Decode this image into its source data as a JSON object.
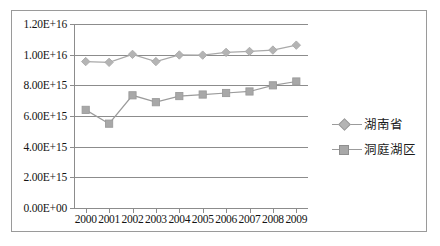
{
  "chart_data": {
    "type": "line",
    "title": "",
    "xlabel": "",
    "ylabel": "",
    "grid": true,
    "legend_position": "right",
    "categories": [
      "2000",
      "2001",
      "2002",
      "2003",
      "2004",
      "2005",
      "2006",
      "2007",
      "2008",
      "2009"
    ],
    "ylim": [
      0,
      1.2e+16
    ],
    "ytick_labels": [
      "0.00E+00",
      "2.00E+15",
      "4.00E+15",
      "6.00E+15",
      "8.00E+15",
      "1.00E+16",
      "1.20E+16"
    ],
    "ytick_values": [
      0,
      2000000000000000.0,
      4000000000000000.0,
      6000000000000000.0,
      8000000000000000.0,
      1e+16,
      1.2e+16
    ],
    "series": [
      {
        "name": "湖南省",
        "marker": "diamond",
        "color": "#b4b4b4",
        "line_color": "#a9a9a9",
        "values": [
          9550000000000000.0,
          9500000000000000.0,
          1.002e+16,
          9550000000000000.0,
          9980000000000000.0,
          9970000000000000.0,
          1.015e+16,
          1.021e+16,
          1.03e+16,
          1.062e+16
        ]
      },
      {
        "name": "洞庭湖区",
        "marker": "square",
        "color": "#a8a8a8",
        "line_color": "#9b9b9b",
        "values": [
          6400000000000000.0,
          5500000000000000.0,
          7350000000000000.0,
          6900000000000000.0,
          7300000000000000.0,
          7400000000000000.0,
          7500000000000000.0,
          7600000000000000.0,
          8000000000000000.0,
          8250000000000000.0
        ]
      }
    ]
  },
  "legend": {
    "entries": [
      {
        "label": "湖南省",
        "marker": "diamond-marker-icon"
      },
      {
        "label": "洞庭湖区",
        "marker": "square-marker-icon"
      }
    ]
  },
  "colors": {
    "axis": "#8c8c8c",
    "grid": "#8c8c8c",
    "border": "#9a9a9a",
    "background": "#ffffff",
    "series_1": "#b4b4b4",
    "series_2": "#a8a8a8"
  }
}
